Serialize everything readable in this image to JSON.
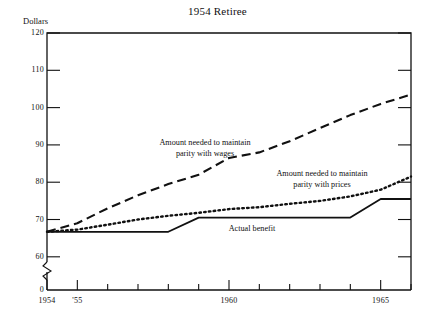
{
  "chart_data": {
    "type": "line",
    "title": "1954 Retiree",
    "xlabel": "",
    "ylabel": "Dollars",
    "xlim": [
      1954,
      1966
    ],
    "ylim": [
      57,
      120
    ],
    "grid": false,
    "legend_position": "inline-annotations",
    "y_axis_break": true,
    "y_break_label": "0",
    "yticks": [
      60,
      70,
      80,
      90,
      100,
      110,
      120
    ],
    "ytick_labels": [
      "60",
      "70",
      "80",
      "90",
      "100",
      "110",
      "120"
    ],
    "xticks": [
      1954,
      1955,
      1956,
      1957,
      1958,
      1959,
      1960,
      1961,
      1962,
      1963,
      1964,
      1965,
      1966
    ],
    "xtick_labels": [
      "1954",
      "'55",
      "",
      "",
      "",
      "",
      "1960",
      "",
      "",
      "",
      "",
      "1965",
      ""
    ],
    "x": [
      1954,
      1955,
      1956,
      1957,
      1958,
      1959,
      1960,
      1961,
      1962,
      1963,
      1964,
      1965,
      1966
    ],
    "series": [
      {
        "name": "Amount needed to maintain parity with wages",
        "style": "dashed",
        "values": [
          66.7,
          69.0,
          73.0,
          76.5,
          79.5,
          82.0,
          86.5,
          88.0,
          91.0,
          94.5,
          98.0,
          101.0,
          103.5
        ]
      },
      {
        "name": "Amount needed to maintain parity with prices",
        "style": "dotted",
        "values": [
          66.7,
          67.3,
          68.6,
          70.0,
          71.0,
          71.8,
          72.8,
          73.3,
          74.2,
          75.0,
          76.2,
          78.0,
          81.5
        ]
      },
      {
        "name": "Actual benefit",
        "style": "solid",
        "values": [
          66.7,
          66.7,
          66.7,
          66.7,
          66.7,
          70.5,
          70.5,
          70.5,
          70.5,
          70.5,
          70.5,
          75.5,
          75.5
        ]
      }
    ],
    "annotations": [
      {
        "name": "wages-annotation",
        "line1": "Amount needed to maintain",
        "line2": "parity with wages",
        "x_px": 205,
        "y_px": 138
      },
      {
        "name": "prices-annotation",
        "line1": "Amount needed to maintain",
        "line2": "parity with prices",
        "x_px": 322,
        "y_px": 169
      },
      {
        "name": "actual-benefit-annotation",
        "line1": "Actual benefit",
        "line2": "",
        "x_px": 252,
        "y_px": 224
      }
    ],
    "colors": {
      "axis": "#111111",
      "wages_line": "#111111",
      "prices_line": "#111111",
      "actual_line": "#111111",
      "background": "#ffffff"
    }
  }
}
